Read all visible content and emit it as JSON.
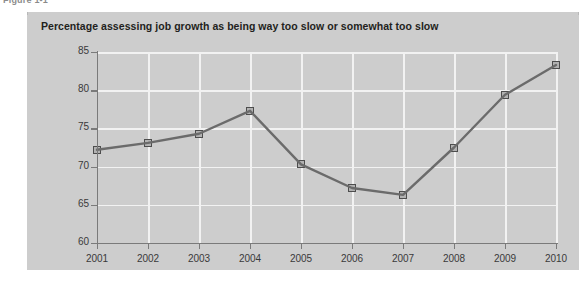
{
  "figure": {
    "caption": "Figure 1-1",
    "title": "Percentage assessing job growth as being way too slow or somewhat too slow"
  },
  "colors": {
    "panel_background": "#cdcdcd",
    "gridline": "#f2f2f2",
    "axis": "#7a7a7a",
    "line": "#6b6b6b",
    "marker_fill": "#b2b2b2",
    "marker_border": "#4d4d4d",
    "title_text": "#231f20",
    "tick_text": "#3a3a3a",
    "top_rule": "#6e6e6e"
  },
  "chart_data": {
    "type": "line",
    "title": "Percentage assessing job growth as being way too slow or somewhat too slow",
    "xlabel": "",
    "ylabel": "",
    "categories": [
      "2001",
      "2002",
      "2003",
      "2004",
      "2005",
      "2006",
      "2007",
      "2008",
      "2009",
      "2010"
    ],
    "x": [
      2001,
      2002,
      2003,
      2004,
      2005,
      2006,
      2007,
      2008,
      2009,
      2010
    ],
    "values": [
      72.2,
      73.1,
      74.3,
      77.3,
      70.3,
      67.2,
      66.3,
      72.5,
      79.4,
      83.3
    ],
    "ylim": [
      60,
      85
    ],
    "yticks": [
      60,
      65,
      70,
      75,
      80,
      85
    ],
    "ytick_labels": [
      "60",
      "65",
      "70",
      "75",
      "80",
      "85"
    ],
    "xlim": [
      2001,
      2010
    ],
    "grid": true,
    "grid_axis": "both",
    "legend": false,
    "legend_position": "none",
    "marker": "square"
  }
}
